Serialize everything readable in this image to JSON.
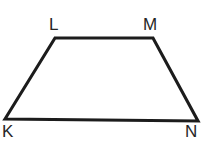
{
  "figure": {
    "name": "trapezoid-klmn",
    "shape_type": "trapezoid",
    "background_color": "#ffffff",
    "stroke_color": "#1c1c1c",
    "stroke_width": 3.1,
    "canvas": {
      "width": 204,
      "height": 155
    },
    "polygon_points": "5,119 55,38 153,38 198,121",
    "vertices": [
      {
        "id": "K",
        "label": "K",
        "x": 5,
        "y": 119,
        "label_x": 2,
        "label_y": 123
      },
      {
        "id": "L",
        "label": "L",
        "x": 55,
        "y": 38,
        "label_x": 49,
        "label_y": 16
      },
      {
        "id": "M",
        "label": "M",
        "x": 153,
        "y": 38,
        "label_x": 143,
        "label_y": 16
      },
      {
        "id": "N",
        "label": "N",
        "x": 198,
        "y": 121,
        "label_x": 185,
        "label_y": 123
      }
    ],
    "edges": [
      {
        "id": "KL",
        "from": "K",
        "to": "L"
      },
      {
        "id": "LM",
        "from": "L",
        "to": "M"
      },
      {
        "id": "MN",
        "from": "M",
        "to": "N"
      },
      {
        "id": "NK",
        "from": "N",
        "to": "K"
      }
    ]
  }
}
